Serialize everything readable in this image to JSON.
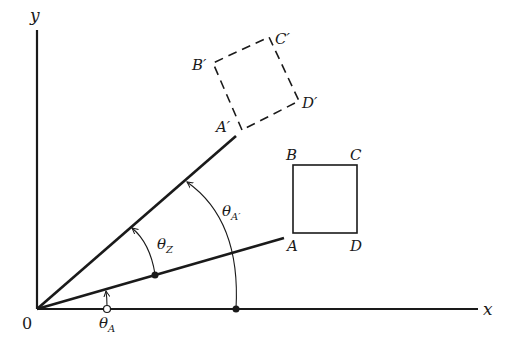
{
  "axes": {
    "x_label": "x",
    "y_label": "y",
    "origin_label": "0"
  },
  "square_original": {
    "corners": {
      "A": "A",
      "B": "B",
      "C": "C",
      "D": "D"
    },
    "style": "solid"
  },
  "square_rotated": {
    "corners": {
      "A": "A′",
      "B": "B′",
      "C": "C′",
      "D": "D′"
    },
    "style": "dashed"
  },
  "angles": {
    "theta_A": {
      "symbol": "θ",
      "subscript": "A"
    },
    "theta_Z": {
      "symbol": "θ",
      "subscript": "Z"
    },
    "theta_A_prime": {
      "symbol": "θ",
      "subscript": "A′"
    }
  },
  "colors": {
    "ink": "#1a1a1a",
    "background": "#ffffff"
  }
}
